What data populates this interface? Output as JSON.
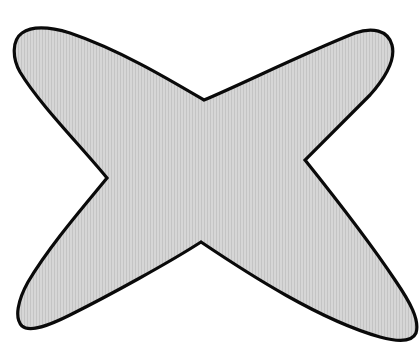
{
  "figure": {
    "title": "Four-pointed star shape with concave sides",
    "background_color": "#ffffff",
    "shape": {
      "kind": "four-lobed star",
      "fill_color": "#d4d4d4",
      "stripe_color": "#c6c6c6",
      "outline_color": "#0a0a0a",
      "outline_width": 3.2,
      "lobes": [
        "top-left",
        "top-right",
        "bottom-left",
        "bottom-right"
      ],
      "notches": {
        "top": [
          204,
          100
        ],
        "right": [
          305,
          160
        ],
        "bottom": [
          201,
          242
        ],
        "left": [
          107,
          178
        ]
      }
    }
  }
}
